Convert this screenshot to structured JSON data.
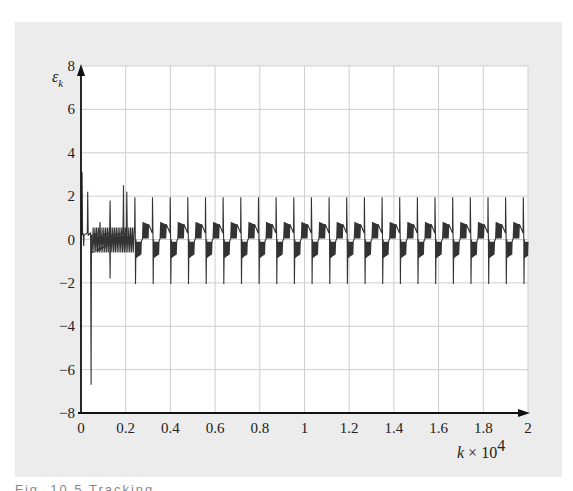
{
  "chart_data": {
    "type": "line",
    "title": "",
    "xlabel": "k × 10^4",
    "xlabel_parts": {
      "var": "k",
      "times": " × 10",
      "exp": "4"
    },
    "ylabel": "ε_k",
    "ylabel_parts": {
      "var": "ε",
      "sub": "k"
    },
    "xlim": [
      0,
      2
    ],
    "ylim": [
      -8,
      8
    ],
    "x_ticks": [
      0,
      0.2,
      0.4,
      0.6,
      0.8,
      1,
      1.2,
      1.4,
      1.6,
      1.8,
      2
    ],
    "x_tick_labels": [
      "0",
      "0.2",
      "0.4",
      "0.6",
      "0.8",
      "1",
      "1.2",
      "1.4",
      "1.6",
      "1.8",
      "2"
    ],
    "y_ticks": [
      -8,
      -6,
      -4,
      -2,
      0,
      2,
      4,
      6,
      8
    ],
    "y_tick_labels": [
      "−8",
      "−6",
      "−4",
      "−2",
      "0",
      "2",
      "4",
      "6",
      "8"
    ],
    "grid": true,
    "legend": null,
    "series": [
      {
        "name": "ε_k",
        "color": "#333333",
        "description": "Initial transient then periodic spiking error signal",
        "transient": [
          {
            "x": 0.005,
            "y": 3.1
          },
          {
            "x": 0.012,
            "y": -0.3
          },
          {
            "x": 0.03,
            "y": 2.2
          },
          {
            "x": 0.045,
            "y": -6.7
          },
          {
            "x": 0.085,
            "y": 0.8
          },
          {
            "x": 0.13,
            "y": 1.8
          },
          {
            "x": 0.13,
            "y": -1.8
          },
          {
            "x": 0.19,
            "y": 2.5
          },
          {
            "x": 0.205,
            "y": 2.2
          }
        ],
        "periodic": {
          "start": 0.24,
          "end": 2.0,
          "period": 0.079,
          "peak_high": 1.95,
          "peak_low": -2.05,
          "band_high": 0.8,
          "band_low": -0.85
        }
      }
    ],
    "annotations": []
  },
  "panel": {
    "background": "#ececec",
    "plot_background": "#ffffff",
    "grid_color": "#cfcfcf",
    "axis_color": "#111111"
  },
  "caption": {
    "text": "Fig. 10.5  Tracking error",
    "visible": "clipped"
  }
}
